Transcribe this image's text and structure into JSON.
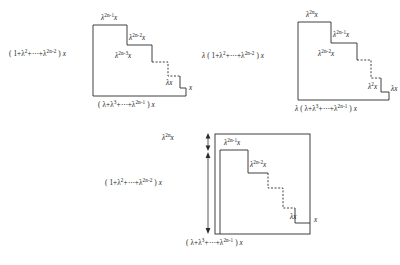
{
  "document": {
    "type": "mathematical-figure",
    "description": "Three staircase region diagrams illustrating geometric series identities"
  },
  "figure1": {
    "name": "Staircase diagram 1",
    "left_label": "( 1+λ²+⋯+λ^{2n-2} ) x",
    "left_label_parts": {
      "prefix": "( 1+λ",
      "e1": "2",
      "mid": "+⋯+λ",
      "e2": "2n-2",
      "suffix": " ) ",
      "var": "x"
    },
    "bottom_label_parts": {
      "prefix": "( λ+λ",
      "e1": "3",
      "mid": "+⋯+λ",
      "e2": "2n-1",
      "suffix": " ) ",
      "var": "x"
    },
    "steps": [
      {
        "base": "λ",
        "exp": "2n-1",
        "var": "x"
      },
      {
        "base": "λ",
        "exp": "2n-2",
        "var": "x"
      },
      {
        "base": "λ",
        "exp": "2n-3",
        "var": "x"
      },
      {
        "base": "λ",
        "exp": "",
        "var": "x"
      }
    ],
    "right_label": "x"
  },
  "figure2": {
    "name": "Staircase diagram 2",
    "lambda_prefix": "λ",
    "left_label_parts": {
      "prefix": "( 1+λ",
      "e1": "2",
      "mid": "+⋯+λ",
      "e2": "2n-2",
      "suffix": " ) ",
      "var": "x"
    },
    "bottom_label_parts": {
      "prefix": "( λ+λ",
      "e1": "3",
      "mid": "+⋯+λ",
      "e2": "2n-1",
      "suffix": " ) ",
      "var": "x"
    },
    "steps": [
      {
        "base": "λ",
        "exp": "2n",
        "var": "x"
      },
      {
        "base": "λ",
        "exp": "2n-1",
        "var": "x"
      },
      {
        "base": "λ",
        "exp": "2n-2",
        "var": "x"
      },
      {
        "base": "λ",
        "exp": "2",
        "var": "x"
      }
    ],
    "right_label": "λx"
  },
  "figure3": {
    "name": "Combined staircase diagram 3",
    "left_label_parts": {
      "prefix": "( 1+λ",
      "e1": "2",
      "mid": "+⋯+λ",
      "e2": "2n-2",
      "suffix": " ) ",
      "var": "x"
    },
    "bottom_label_parts": {
      "prefix": "( λ+λ",
      "e1": "3",
      "mid": "+⋯+λ",
      "e2": "2n-1",
      "suffix": " ) ",
      "var": "x"
    },
    "top_measure": {
      "base": "λ",
      "exp": "2n",
      "var": "x"
    },
    "steps": [
      {
        "base": "λ",
        "exp": "2n-1",
        "var": "x"
      },
      {
        "base": "λ",
        "exp": "2n-2",
        "var": "x"
      },
      {
        "base": "λ",
        "exp": "",
        "var": "x"
      }
    ],
    "right_label": "x"
  },
  "colors": {
    "ink": "#2b2b2b",
    "background": "#ffffff"
  }
}
